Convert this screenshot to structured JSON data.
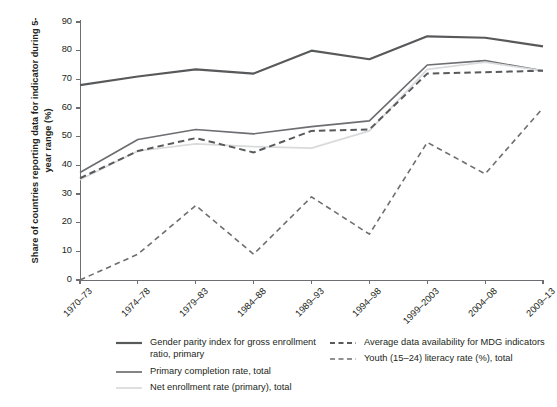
{
  "title": {
    "text": "",
    "note": "cropped-off heading at top edge, illegible"
  },
  "axes": {
    "ylabel": "Share of countries reporting data for indicator during 5-year range (%)",
    "xlabel": "",
    "yticks": [
      0,
      10,
      20,
      30,
      40,
      50,
      60,
      70,
      80,
      90
    ],
    "ylim": [
      0,
      90
    ]
  },
  "colors": {
    "dark_gray": "#58595b",
    "mid_gray": "#6d6e71",
    "light_gray": "#d9dadb",
    "axis": "#6d6e71",
    "text": "#231f20"
  },
  "legend": {
    "left_column": [
      {
        "label": "Gender parity index for gross enrollment ratio, primary",
        "style": "solid",
        "color": "#58595b",
        "width": 2.2
      },
      {
        "label": "Primary completion rate, total",
        "style": "solid",
        "color": "#6d6e71",
        "width": 1.7
      },
      {
        "label": "Net enrollment rate (primary), total",
        "style": "solid",
        "color": "#d9dadb",
        "width": 1.7
      }
    ],
    "right_column": [
      {
        "label": "Average data availability for MDG indicators",
        "style": "dashed",
        "color": "#58595b",
        "width": 2.0
      },
      {
        "label": "Youth (15–24) literacy rate (%), total",
        "style": "dashed",
        "color": "#6d6e71",
        "width": 1.6
      }
    ]
  },
  "chart_data": {
    "type": "line",
    "title": "",
    "xlabel": "",
    "ylabel": "Share of countries reporting data for indicator during 5-year range (%)",
    "ylim": [
      0,
      90
    ],
    "grid": false,
    "legend_position": "bottom",
    "categories": [
      "1970–73",
      "1974–78",
      "1979–83",
      "1984–88",
      "1989–93",
      "1994–98",
      "1999–2003",
      "2004–08",
      "2009–13"
    ],
    "series": [
      {
        "name": "Gender parity index for gross enrollment ratio, primary",
        "style": "solid",
        "color": "#58595b",
        "values": [
          68,
          71,
          73.5,
          72,
          80,
          77,
          85,
          84.5,
          81.5
        ]
      },
      {
        "name": "Primary completion rate, total",
        "style": "solid",
        "color": "#6d6e71",
        "values": [
          37.5,
          49,
          52.5,
          51,
          53.5,
          55.5,
          75,
          76.5,
          73
        ]
      },
      {
        "name": "Net enrollment rate (primary), total",
        "style": "solid",
        "color": "#d9dadb",
        "values": [
          35,
          45,
          47.5,
          46.5,
          46,
          52,
          73.5,
          76,
          73
        ]
      },
      {
        "name": "Average data availability for MDG indicators",
        "style": "dashed",
        "color": "#58595b",
        "values": [
          35.5,
          45,
          49.5,
          44.5,
          52,
          52.5,
          72,
          72.5,
          73
        ]
      },
      {
        "name": "Youth (15–24) literacy rate (%), total",
        "style": "dashed",
        "color": "#6d6e71",
        "values": [
          0,
          9,
          26,
          9,
          29,
          16,
          48,
          37,
          60
        ]
      }
    ]
  }
}
